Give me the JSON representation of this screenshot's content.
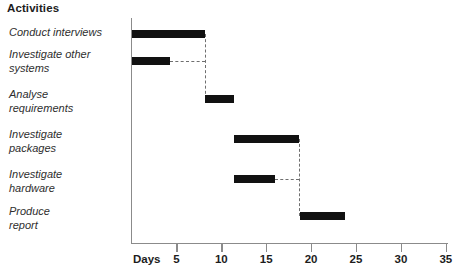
{
  "header": {
    "title": "Activities"
  },
  "axis": {
    "x_title": "Days",
    "ticks": [
      {
        "value": 5,
        "label": "5"
      },
      {
        "value": 10,
        "label": "10"
      },
      {
        "value": 15,
        "label": "15"
      },
      {
        "value": 20,
        "label": "20"
      },
      {
        "value": 25,
        "label": "25"
      },
      {
        "value": 30,
        "label": "30"
      },
      {
        "value": 35,
        "label": "35"
      }
    ]
  },
  "activities": [
    {
      "label": "Conduct interviews"
    },
    {
      "label": "Investigate other\nsystems"
    },
    {
      "label": "Analyse\nrequirements"
    },
    {
      "label": "Investigate\npackages"
    },
    {
      "label": "Investigate\nhardware"
    },
    {
      "label": "Produce\nreport"
    }
  ],
  "chart_data": {
    "type": "bar",
    "title": "Activities",
    "xlabel": "Days",
    "ylabel": "",
    "xlim": [
      0,
      35
    ],
    "grid": false,
    "legend": null,
    "orientation": "horizontal-gantt",
    "categories": [
      "Conduct interviews",
      "Investigate other systems",
      "Analyse requirements",
      "Investigate packages",
      "Investigate hardware",
      "Produce report"
    ],
    "tasks": [
      {
        "name": "Conduct interviews",
        "start": 0,
        "end": 8.2,
        "duration": 8.2
      },
      {
        "name": "Investigate other systems",
        "start": 0,
        "end": 4.3,
        "duration": 4.3
      },
      {
        "name": "Analyse requirements",
        "start": 8.2,
        "end": 11.4,
        "duration": 3.2
      },
      {
        "name": "Investigate packages",
        "start": 11.4,
        "end": 18.6,
        "duration": 7.2
      },
      {
        "name": "Investigate hardware",
        "start": 11.4,
        "end": 16.0,
        "duration": 4.6
      },
      {
        "name": "Produce report",
        "start": 18.8,
        "end": 23.8,
        "duration": 5.0
      }
    ],
    "dependencies": [
      {
        "from": "Conduct interviews",
        "to": "Analyse requirements",
        "at_day": 8.2
      },
      {
        "from": "Investigate other systems",
        "to": "Analyse requirements",
        "at_day": 8.2
      },
      {
        "from": "Investigate packages",
        "to": "Produce report",
        "at_day": 18.6
      },
      {
        "from": "Investigate hardware",
        "to": "Produce report",
        "at_day": 18.6
      }
    ],
    "bar_color": "#111111",
    "axis_color": "#8b8b8b",
    "link_color": "#6f6f6f"
  },
  "geometry": {
    "origin_x": 131.5,
    "px_per_day": 8.98,
    "row_bar_y": [
      30,
      57,
      95,
      135,
      175,
      212
    ],
    "row_label_y": [
      26,
      48,
      88,
      128,
      168,
      205
    ]
  }
}
